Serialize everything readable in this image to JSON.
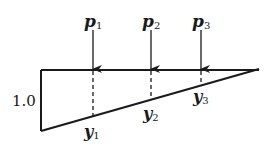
{
  "diagram": {
    "type": "influence-line",
    "shape": "right triangle",
    "ordinate_label": "1.0",
    "loads": [
      {
        "label": "p",
        "sub": "1",
        "x": 93
      },
      {
        "label": "p",
        "sub": "2",
        "x": 151
      },
      {
        "label": "p",
        "sub": "3",
        "x": 201
      }
    ],
    "ordinates": [
      {
        "label": "y",
        "sub": "1",
        "x": 93
      },
      {
        "label": "y",
        "sub": "2",
        "x": 151
      },
      {
        "label": "y",
        "sub": "3",
        "x": 201
      }
    ],
    "colors": {
      "stroke": "#1a1a1a",
      "background": "#ffffff"
    }
  }
}
